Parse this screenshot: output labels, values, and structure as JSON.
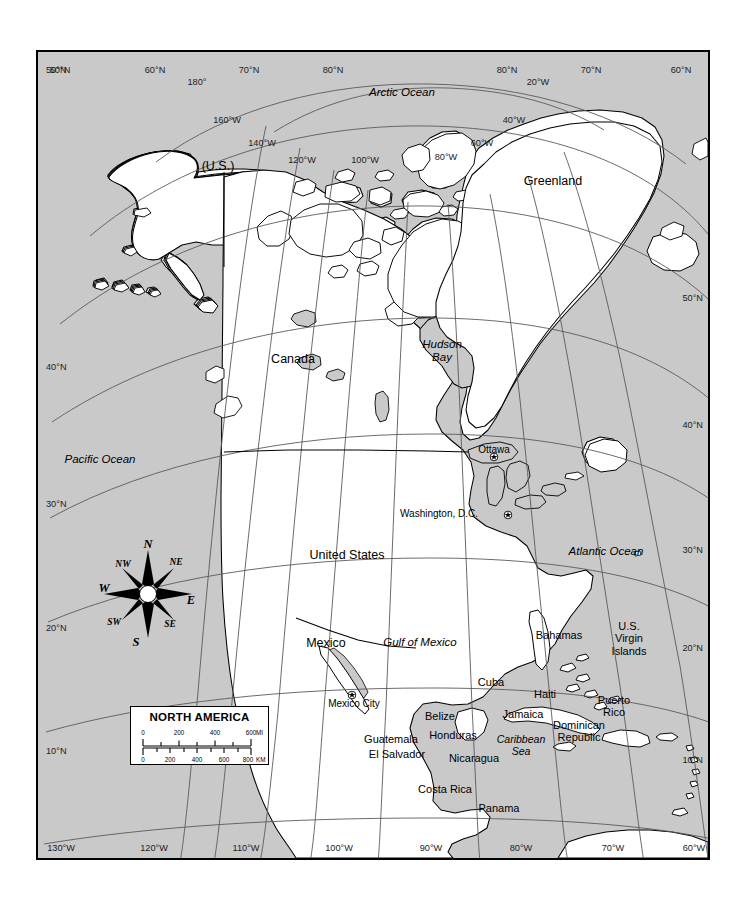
{
  "figure": {
    "title": "North America",
    "map_type": "reference-political-map",
    "projection_hint": "conic",
    "colors": {
      "ocean": "#c9c9c9",
      "land": "#ffffff",
      "lake": "#c9c9c9",
      "coastline": "#000000",
      "graticule": "#5a5a5a",
      "frame": "#000000",
      "page": "#ffffff"
    }
  },
  "legend": {
    "title": "NORTH AMERICA",
    "scales": [
      {
        "unit": "MI",
        "ticks": [
          "0",
          "200",
          "400",
          "600"
        ],
        "tick_values": [
          0,
          200,
          400,
          600
        ]
      },
      {
        "unit": "KM",
        "ticks": [
          "0",
          "200",
          "400",
          "600",
          "800"
        ],
        "tick_values": [
          0,
          200,
          400,
          600,
          800
        ]
      }
    ]
  },
  "compass": {
    "points": [
      {
        "label": "N",
        "kind": "cardinal"
      },
      {
        "label": "NE",
        "kind": "intercardinal"
      },
      {
        "label": "E",
        "kind": "cardinal"
      },
      {
        "label": "SE",
        "kind": "intercardinal"
      },
      {
        "label": "S",
        "kind": "cardinal"
      },
      {
        "label": "SW",
        "kind": "intercardinal"
      },
      {
        "label": "W",
        "kind": "cardinal"
      },
      {
        "label": "NW",
        "kind": "intercardinal"
      }
    ]
  },
  "labels": {
    "countries": [
      {
        "name": "Canada",
        "x": 291,
        "y": 350
      },
      {
        "name": "United States",
        "x": 345,
        "y": 546
      },
      {
        "name": "Mexico",
        "x": 324,
        "y": 634
      },
      {
        "name": "Greenland",
        "x": 551,
        "y": 172
      },
      {
        "name": "(U.S.)",
        "x": 216,
        "y": 157
      }
    ],
    "central_america": [
      {
        "name": "Belize",
        "x": 438,
        "y": 708
      },
      {
        "name": "Guatemala",
        "x": 389,
        "y": 731
      },
      {
        "name": "Honduras",
        "x": 451,
        "y": 727
      },
      {
        "name": "El Salvador",
        "x": 395,
        "y": 746
      },
      {
        "name": "Nicaragua",
        "x": 472,
        "y": 750
      },
      {
        "name": "Costa Rica",
        "x": 443,
        "y": 781
      },
      {
        "name": "Panama",
        "x": 497,
        "y": 800
      }
    ],
    "caribbean": [
      {
        "name": "Cuba",
        "x": 489,
        "y": 674
      },
      {
        "name": "Bahamas",
        "x": 557,
        "y": 627
      },
      {
        "name": "Haiti",
        "x": 543,
        "y": 686
      },
      {
        "name": "Jamaica",
        "x": 521,
        "y": 706
      },
      {
        "name": "Dominican\nRepublic",
        "x": 577,
        "y": 717
      },
      {
        "name": "Puerto\nRico",
        "x": 612,
        "y": 692
      },
      {
        "name": "U.S.\nVirgin\nIslands",
        "x": 627,
        "y": 618
      }
    ],
    "water": [
      {
        "name": "Arctic Ocean",
        "x": 400,
        "y": 84,
        "size": "lg"
      },
      {
        "name": "Pacific Ocean",
        "x": 98,
        "y": 451,
        "size": "lg"
      },
      {
        "name": "Atlantic Ocean",
        "x": 604,
        "y": 543,
        "size": "lg"
      },
      {
        "name": "Hudson\nBay",
        "x": 440,
        "y": 336,
        "size": "lg"
      },
      {
        "name": "Gulf of Mexico",
        "x": 418,
        "y": 634,
        "size": "lg"
      },
      {
        "name": "Caribbean\nSea",
        "x": 519,
        "y": 732,
        "size": "sm"
      }
    ],
    "cities": [
      {
        "name": "Ottawa",
        "x": 492,
        "y": 442,
        "dot_x": 492,
        "dot_y": 450,
        "anchor": "above",
        "capital": true
      },
      {
        "name": "Washington, D.C.",
        "x": 476,
        "y": 506,
        "dot_x": 506,
        "dot_y": 508,
        "anchor": "left",
        "capital": true
      },
      {
        "name": "Mexico City",
        "x": 352,
        "y": 696,
        "dot_x": 350,
        "dot_y": 688,
        "anchor": "below",
        "capital": true
      }
    ]
  },
  "graticule": {
    "latitude_labels_left": [
      "50°N",
      "40°N",
      "30°N",
      "20°N",
      "10°N"
    ],
    "latitude_labels_right": [
      "50°N",
      "40°N",
      "30°N",
      "20°N",
      "10°N"
    ],
    "longitude_labels_bottom": [
      "130°W",
      "120°W",
      "110°W",
      "100°W",
      "90°W",
      "80°W",
      "70°W",
      "60°W"
    ],
    "top_labels": [
      "50°N",
      "60°N",
      "70°N",
      "80°N",
      "80°N",
      "70°N",
      "60°N"
    ],
    "interior_meridian_labels": [
      "180°",
      "160°W",
      "140°W",
      "120°W",
      "100°W",
      "80°W",
      "60°W",
      "40°W",
      "20°W"
    ],
    "placed": {
      "left": [
        {
          "text": "50°N",
          "x": 44,
          "y": 63
        },
        {
          "text": "40°N",
          "x": 44,
          "y": 360
        },
        {
          "text": "30°N",
          "x": 44,
          "y": 497
        },
        {
          "text": "20°N",
          "x": 44,
          "y": 621
        },
        {
          "text": "10°N",
          "x": 44,
          "y": 744
        }
      ],
      "right": [
        {
          "text": "50°N",
          "x": 701,
          "y": 291
        },
        {
          "text": "40°N",
          "x": 701,
          "y": 418
        },
        {
          "text": "30°N",
          "x": 701,
          "y": 543
        },
        {
          "text": "20°N",
          "x": 701,
          "y": 641
        },
        {
          "text": "10°N",
          "x": 701,
          "y": 753
        }
      ],
      "bottom": [
        {
          "text": "130°W",
          "x": 59,
          "y": 841
        },
        {
          "text": "120°W",
          "x": 152,
          "y": 841
        },
        {
          "text": "110°W",
          "x": 244,
          "y": 841
        },
        {
          "text": "100°W",
          "x": 337,
          "y": 841
        },
        {
          "text": "90°W",
          "x": 429,
          "y": 841
        },
        {
          "text": "80°W",
          "x": 519,
          "y": 841
        },
        {
          "text": "70°W",
          "x": 611,
          "y": 841
        },
        {
          "text": "60°W",
          "x": 692,
          "y": 841
        }
      ],
      "top": [
        {
          "text": "50°N",
          "x": 58,
          "y": 63
        },
        {
          "text": "60°N",
          "x": 153,
          "y": 63
        },
        {
          "text": "70°N",
          "x": 247,
          "y": 63
        },
        {
          "text": "80°N",
          "x": 331,
          "y": 63
        },
        {
          "text": "80°N",
          "x": 505,
          "y": 63
        },
        {
          "text": "70°N",
          "x": 589,
          "y": 63
        },
        {
          "text": "60°N",
          "x": 679,
          "y": 63
        }
      ],
      "interior": [
        {
          "text": "180°",
          "x": 195,
          "y": 75
        },
        {
          "text": "20°W",
          "x": 536,
          "y": 75
        },
        {
          "text": "160°W",
          "x": 225,
          "y": 113
        },
        {
          "text": "40°W",
          "x": 512,
          "y": 113
        },
        {
          "text": "140°W",
          "x": 260,
          "y": 136
        },
        {
          "text": "60°W",
          "x": 480,
          "y": 136
        },
        {
          "text": "120°W",
          "x": 300,
          "y": 153
        },
        {
          "text": "100°W",
          "x": 363,
          "y": 153
        },
        {
          "text": "80°W",
          "x": 444,
          "y": 150
        }
      ]
    }
  }
}
